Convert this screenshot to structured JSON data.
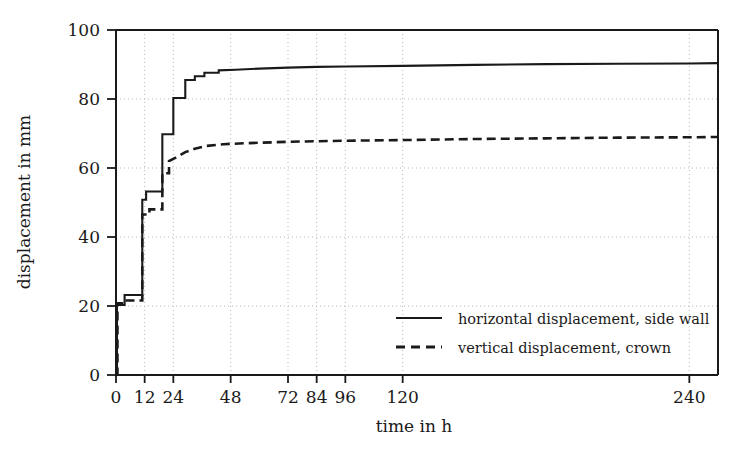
{
  "chart_data": {
    "type": "line",
    "title": "",
    "xlabel": "time in h",
    "ylabel": "displacement in mm",
    "xlim": [
      0,
      252
    ],
    "ylim": [
      0,
      100
    ],
    "xticks": [
      0,
      12,
      24,
      48,
      72,
      84,
      96,
      120,
      240
    ],
    "xtick_labels": [
      "0",
      "12",
      "24",
      "48",
      "72",
      "84",
      "96",
      "120",
      "240"
    ],
    "yticks": [
      0,
      20,
      40,
      60,
      80,
      100
    ],
    "ytick_labels": [
      "0",
      "20",
      "40",
      "60",
      "80",
      "100"
    ],
    "grid": "dotted, both axes, at major ticks",
    "legend_position": "center-right inside axes",
    "line_color": "#1a1a1a",
    "grid_color": "#b9b9b9",
    "axis_color": "#1a1a1a",
    "background_color": "#ffffff",
    "series": [
      {
        "name": "horizontal displacement, side wall",
        "style": "solid",
        "points": [
          [
            0.0,
            0.0
          ],
          [
            0.4,
            0.0
          ],
          [
            0.4,
            20.3
          ],
          [
            3.6,
            20.3
          ],
          [
            3.6,
            23.2
          ],
          [
            11.0,
            23.2
          ],
          [
            11.0,
            50.8
          ],
          [
            12.6,
            50.8
          ],
          [
            12.6,
            53.2
          ],
          [
            19.4,
            53.2
          ],
          [
            19.4,
            69.8
          ],
          [
            24.0,
            69.8
          ],
          [
            24.0,
            80.3
          ],
          [
            29.0,
            80.3
          ],
          [
            29.0,
            85.5
          ],
          [
            33.0,
            85.5
          ],
          [
            33.0,
            86.6
          ],
          [
            37.0,
            86.6
          ],
          [
            37.0,
            87.6
          ],
          [
            43.0,
            87.6
          ],
          [
            43.0,
            88.3
          ],
          [
            50.0,
            88.5
          ],
          [
            60.0,
            88.8
          ],
          [
            72.0,
            89.1
          ],
          [
            84.0,
            89.3
          ],
          [
            96.0,
            89.4
          ],
          [
            120.0,
            89.6
          ],
          [
            150.0,
            89.9
          ],
          [
            180.0,
            90.1
          ],
          [
            210.0,
            90.2
          ],
          [
            240.0,
            90.3
          ],
          [
            252.0,
            90.4
          ]
        ]
      },
      {
        "name": "vertical displacement, crown",
        "style": "dashed",
        "points": [
          [
            0.0,
            0.0
          ],
          [
            0.6,
            0.0
          ],
          [
            0.6,
            20.8
          ],
          [
            3.6,
            20.8
          ],
          [
            3.6,
            21.6
          ],
          [
            11.0,
            21.6
          ],
          [
            11.0,
            46.5
          ],
          [
            14.0,
            46.5
          ],
          [
            14.0,
            48.0
          ],
          [
            19.4,
            48.0
          ],
          [
            19.4,
            58.5
          ],
          [
            22.2,
            58.5
          ],
          [
            22.2,
            62.0
          ],
          [
            25.0,
            63.0
          ],
          [
            29.0,
            64.6
          ],
          [
            33.0,
            65.6
          ],
          [
            38.0,
            66.4
          ],
          [
            45.0,
            66.9
          ],
          [
            55.0,
            67.2
          ],
          [
            72.0,
            67.6
          ],
          [
            96.0,
            67.9
          ],
          [
            120.0,
            68.1
          ],
          [
            150.0,
            68.4
          ],
          [
            180.0,
            68.6
          ],
          [
            210.0,
            68.8
          ],
          [
            240.0,
            68.9
          ],
          [
            252.0,
            69.0
          ]
        ]
      }
    ],
    "annotations": []
  },
  "legend": {
    "items": [
      {
        "label": "horizontal displacement, side wall",
        "style": "solid"
      },
      {
        "label": "vertical displacement, crown",
        "style": "dashed"
      }
    ]
  }
}
